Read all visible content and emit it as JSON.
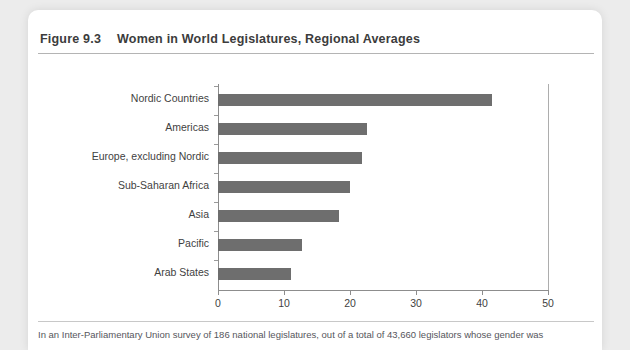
{
  "figure": {
    "label": "Figure 9.3",
    "title": "Women in World Legislatures, Regional Averages",
    "caption": "In an Inter-Parliamentary Union survey of 186 national legislatures, out of a total of 43,660 legislators whose gender was"
  },
  "colors": {
    "bar": "#6e6e6e",
    "axis": "#8d8d8d",
    "text": "#3f3f3f",
    "title_text": "#3c3c3c",
    "card": "#ffffff",
    "page_background": "#ececec"
  },
  "chart_data": {
    "type": "bar",
    "orientation": "horizontal",
    "title": "Women in World Legislatures, Regional Averages",
    "xlabel": "",
    "ylabel": "",
    "categories": [
      "Nordic Countries",
      "Americas",
      "Europe, excluding Nordic",
      "Sub-Saharan Africa",
      "Asia",
      "Pacific",
      "Arab States"
    ],
    "values": [
      41.5,
      22.5,
      21.8,
      20.0,
      18.3,
      12.8,
      11.0
    ],
    "xlim": [
      0,
      50
    ],
    "xticks": [
      0,
      10,
      20,
      30,
      40,
      50
    ],
    "xtick_labels": [
      "0",
      "10",
      "20",
      "30",
      "40",
      "50"
    ],
    "grid": false,
    "legend": null
  }
}
